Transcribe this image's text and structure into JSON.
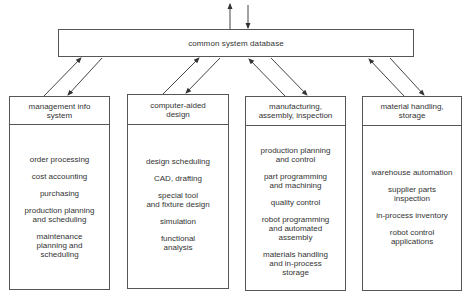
{
  "database": {
    "label": "common system database"
  },
  "modules": [
    {
      "title": "management info\nsystem",
      "items": [
        "order processing",
        "cost accounting",
        "purchasing",
        "production  planning\nand scheduling",
        "maintenance\nplanning and\nscheduling"
      ]
    },
    {
      "title": "computer-aided\ndesign",
      "items": [
        "design scheduling",
        "CAD, drafting",
        "special tool\nand fixture design",
        "simulation",
        "functional\nanalysis"
      ]
    },
    {
      "title": "manufacturing,\nassembly, inspection",
      "items": [
        "production planning\nand control",
        "part programming\nand machining",
        "quality control",
        "robot programming\nand automated\nassembly",
        "materials handling\nand in-process\nstorage"
      ]
    },
    {
      "title": "material handling,\nstorage",
      "items": [
        "warehouse automation",
        "supplier parts\ninspection",
        "in-process inventory",
        "robot control\napplications"
      ]
    }
  ],
  "connectors": {
    "external": [
      "outgoing-up",
      "incoming-down"
    ],
    "per_module": [
      "to-database",
      "from-database"
    ]
  }
}
